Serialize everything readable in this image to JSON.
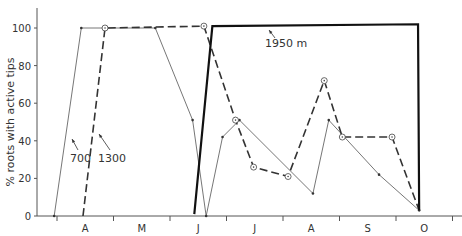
{
  "chart_data": {
    "type": "line",
    "title": "",
    "xlabel": "",
    "ylabel": "% roots with active tips",
    "ylim": [
      0,
      110
    ],
    "yticks": [
      0,
      20,
      40,
      60,
      80,
      100
    ],
    "x_month_labels": [
      "A",
      "M",
      "J",
      "J",
      "A",
      "S",
      "O"
    ],
    "x_note": "x values are month positions: 0 = start of April tick, each month = 1.0",
    "grid": false,
    "legend": "inline annotations",
    "annotations": [
      {
        "text": "700",
        "target_series": "700"
      },
      {
        "text": "1300",
        "target_series": "1300"
      },
      {
        "text": "1950 m",
        "target_series": "1950 m"
      }
    ],
    "series": [
      {
        "name": "700",
        "style": "thin solid, dot markers",
        "x": [
          -0.05,
          0.43,
          1.74,
          2.4,
          2.64,
          2.93,
          3.23,
          4.53,
          4.81,
          5.7,
          6.41
        ],
        "y": [
          0,
          100,
          100,
          51,
          0,
          42,
          51,
          12,
          51,
          22,
          3
        ]
      },
      {
        "name": "1300",
        "style": "dashed, circle markers",
        "x": [
          0.46,
          0.85,
          2.6,
          3.16,
          3.48,
          4.09,
          4.73,
          5.05,
          5.93,
          6.41
        ],
        "y": [
          0,
          100,
          101,
          51,
          26,
          21,
          72,
          42,
          42,
          3
        ]
      },
      {
        "name": "1950 m",
        "style": "thick solid",
        "x": [
          2.43,
          2.75,
          6.39,
          6.41
        ],
        "y": [
          1,
          101,
          102,
          3
        ]
      }
    ]
  },
  "labels": {
    "ylabel": "% roots with active tips",
    "yticks": [
      "0",
      "20",
      "40",
      "60",
      "80",
      "100"
    ],
    "months": [
      "A",
      "M",
      "J",
      "J",
      "A",
      "S",
      "O"
    ],
    "series_700": "700",
    "series_1300": "1300",
    "series_1950": "1950 m"
  }
}
